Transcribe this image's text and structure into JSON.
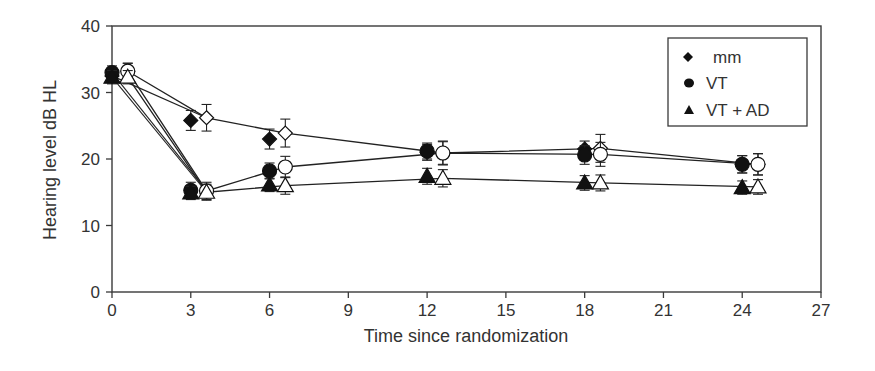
{
  "chart_data": {
    "type": "line",
    "title": "",
    "xlabel": "Time since randomization",
    "ylabel": "Hearing level dB HL",
    "xlim": [
      0,
      27
    ],
    "ylim": [
      0,
      40
    ],
    "xticks": [
      0,
      3,
      6,
      9,
      12,
      15,
      18,
      21,
      24,
      27
    ],
    "yticks": [
      0,
      10,
      20,
      30,
      40
    ],
    "grid": false,
    "legend_position": "upper right",
    "legend": [
      {
        "label": "mm",
        "marker": "diamond"
      },
      {
        "label": "VT",
        "marker": "circle"
      },
      {
        "label": "VT + AD",
        "marker": "triangle"
      }
    ],
    "x": [
      0,
      3,
      6,
      12,
      18,
      24
    ],
    "series": [
      {
        "name": "mm",
        "marker": "diamond",
        "fill": "filled",
        "x_offset": 0,
        "values": [
          32.5,
          25.8,
          23.0,
          21.0,
          21.5,
          19.2
        ],
        "err": [
          1.0,
          1.5,
          1.5,
          1.2,
          1.2,
          1.3
        ],
        "line": false
      },
      {
        "name": "VT",
        "marker": "circle",
        "fill": "filled",
        "x_offset": 0,
        "values": [
          33.0,
          15.3,
          18.2,
          21.2,
          20.6,
          19.2
        ],
        "err": [
          1.0,
          1.2,
          1.2,
          1.2,
          1.4,
          1.3
        ],
        "line": false
      },
      {
        "name": "VT + AD",
        "marker": "triangle",
        "fill": "filled",
        "x_offset": 0,
        "values": [
          32.3,
          14.9,
          16.1,
          17.4,
          16.4,
          15.7
        ],
        "err": [
          1.0,
          1.0,
          1.0,
          1.2,
          1.1,
          1.0
        ],
        "line": false
      },
      {
        "name": "mm",
        "marker": "diamond",
        "fill": "open",
        "x_offset": 0.6,
        "values": [
          33.2,
          26.2,
          23.9,
          20.9,
          21.6,
          19.2
        ],
        "err": [
          1.2,
          2.0,
          2.1,
          1.8,
          2.1,
          1.6
        ],
        "line": true
      },
      {
        "name": "VT",
        "marker": "circle",
        "fill": "open",
        "x_offset": 0.6,
        "values": [
          33.2,
          15.2,
          18.8,
          20.9,
          20.7,
          19.2
        ],
        "err": [
          1.2,
          1.3,
          1.6,
          1.7,
          1.8,
          1.6
        ],
        "line": true
      },
      {
        "name": "VT + AD",
        "marker": "triangle",
        "fill": "open",
        "x_offset": 0.6,
        "values": [
          32.3,
          15.0,
          16.0,
          17.1,
          16.4,
          15.8
        ],
        "err": [
          1.0,
          1.2,
          1.3,
          1.3,
          1.2,
          1.1
        ],
        "line": true
      }
    ]
  },
  "colors": {
    "axis": "#3a3a3a",
    "text": "#333333",
    "marker": "#111111",
    "background": "#ffffff"
  }
}
